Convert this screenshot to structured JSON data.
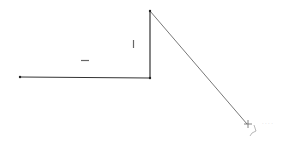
{
  "sketch": {
    "line_color": "#333333",
    "segment_color": "#555555",
    "point_color": "#222222",
    "points": [
      {
        "x": 20,
        "y": 77
      },
      {
        "x": 150,
        "y": 78
      },
      {
        "x": 150,
        "y": 11
      },
      {
        "x": 247,
        "y": 124
      }
    ],
    "constraints": [
      {
        "type": "horizontal",
        "x": 85,
        "y": 60
      },
      {
        "type": "vertical",
        "x": 133,
        "y": 44
      }
    ]
  },
  "cursor": {
    "x": 248,
    "y": 124,
    "tooltip": "· · · ·"
  }
}
